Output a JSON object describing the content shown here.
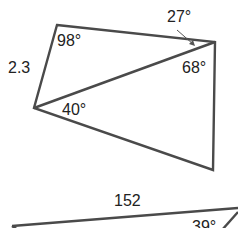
{
  "diagram": {
    "type": "geometry-figure",
    "colors": {
      "stroke": "#4a4a4a",
      "text": "#222222",
      "background": "#ffffff"
    },
    "quadrilateral": {
      "vertices": {
        "top_left": [
          57,
          25
        ],
        "right": [
          215,
          42
        ],
        "bottom_right": [
          213,
          170
        ],
        "left": [
          34,
          108
        ]
      },
      "side_label": "2.3",
      "angles": {
        "top_left": "98°",
        "right_upper": "27°",
        "right_lower": "68°",
        "left_lower": "40°"
      }
    },
    "lower_figure": {
      "side_label": "152",
      "angle": "39°"
    }
  }
}
